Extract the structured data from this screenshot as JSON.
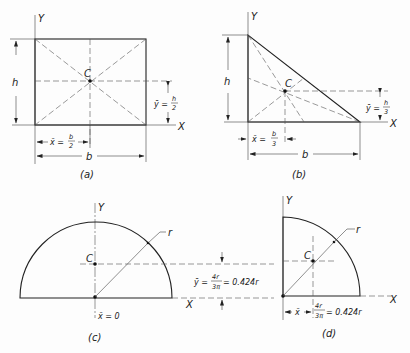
{
  "figure": {
    "a": {
      "caption": "(a)",
      "shape": "rectangle",
      "axis_x": "X",
      "axis_y": "Y",
      "centroid": "C",
      "height_label": "h",
      "width_label": "b",
      "xbar_lhs": "x̄ =",
      "xbar_num": "b",
      "xbar_den": "2",
      "ybar_lhs": "ȳ =",
      "ybar_num": "h",
      "ybar_den": "2"
    },
    "b": {
      "caption": "(b)",
      "shape": "right triangle",
      "axis_x": "X",
      "axis_y": "Y",
      "centroid": "C",
      "height_label": "h",
      "width_label": "b",
      "xbar_lhs": "x̄ =",
      "xbar_num": "b",
      "xbar_den": "3",
      "ybar_lhs": "ȳ =",
      "ybar_num": "h",
      "ybar_den": "3"
    },
    "c": {
      "caption": "(c)",
      "shape": "semicircle",
      "axis_x": "X",
      "axis_y": "Y",
      "centroid": "C",
      "radius_label": "r",
      "xbar": "x̄ = 0",
      "ybar_lhs": "ȳ =",
      "ybar_num": "4r",
      "ybar_den": "3π",
      "ybar_rhs": "= 0.424r"
    },
    "d": {
      "caption": "(d)",
      "shape": "quarter circle",
      "axis_x": "X",
      "axis_y": "Y",
      "centroid": "C",
      "radius_label": "r",
      "xbar_lhs": "x̄",
      "xbar_num": "4r",
      "xbar_den": "3π",
      "xbar_rhs": "= 0.424r"
    }
  }
}
